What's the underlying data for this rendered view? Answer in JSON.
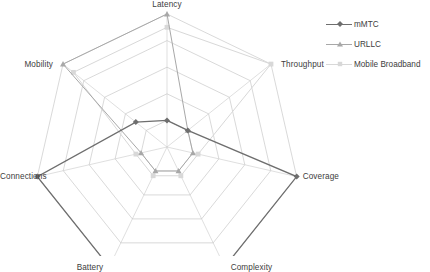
{
  "chart_data": {
    "type": "radar",
    "title": "",
    "subtitle": "",
    "xlabel": "",
    "ylabel": "",
    "grid": true,
    "grid_rings": 5,
    "rlim": [
      0,
      5
    ],
    "legend_position": "right",
    "categories": [
      "Latency",
      "Throughput",
      "Coverage",
      "Complexity",
      "Battery",
      "Connections",
      "Mobility"
    ],
    "series": [
      {
        "name": "mMTC",
        "color": "#6e6e6e",
        "marker": "diamond",
        "values": [
          1.0,
          1.0,
          5.0,
          5.0,
          5.0,
          5.0,
          1.5
        ]
      },
      {
        "name": "URLLC",
        "color": "#a8a8a8",
        "marker": "triangle",
        "values": [
          5.0,
          1.0,
          1.0,
          1.0,
          1.0,
          1.0,
          5.0
        ]
      },
      {
        "name": "Mobile Broadband",
        "color": "#d8d8d8",
        "marker": "square",
        "values": [
          4.5,
          5.0,
          1.2,
          1.2,
          1.2,
          1.2,
          4.5
        ]
      }
    ]
  },
  "chart": {
    "axis_labels": {
      "latency": "Latency",
      "throughput": "Throughput",
      "coverage": "Coverage",
      "complexity": "Complexity",
      "battery": "Battery",
      "connections": "Connections",
      "mobility": "Mobility"
    }
  },
  "legend": {
    "entries": [
      {
        "label": "mMTC"
      },
      {
        "label": "URLLC"
      },
      {
        "label": "Mobile Broadband"
      }
    ]
  },
  "colors": {
    "grid": "#c9c9c9",
    "spoke": "#c9c9c9",
    "text": "#3d3d3d",
    "series_mmtc": "#6e6e6e",
    "series_urllc": "#a8a8a8",
    "series_mobile_broadband": "#d8d8d8",
    "background": "#ffffff"
  }
}
